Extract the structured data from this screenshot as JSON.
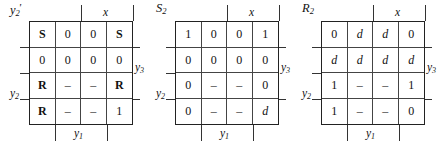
{
  "figure": {
    "type": "karnaugh-maps",
    "map_count": 3
  },
  "maps": [
    {
      "title": "y",
      "title_sub": "2",
      "title_prime": "'",
      "axis": {
        "top": "x",
        "bottom": "y",
        "bottom_sub": "1",
        "right": "y",
        "right_sub": "3",
        "left": "y",
        "left_sub": "2"
      },
      "rows": [
        [
          {
            "text": "S",
            "style": "bold"
          },
          {
            "text": "0",
            "style": "num"
          },
          {
            "text": "0",
            "style": "num"
          },
          {
            "text": "S",
            "style": "bold"
          }
        ],
        [
          {
            "text": "0",
            "style": "num"
          },
          {
            "text": "0",
            "style": "num"
          },
          {
            "text": "0",
            "style": "num"
          },
          {
            "text": "0",
            "style": "num"
          }
        ],
        [
          {
            "text": "R",
            "style": "bold"
          },
          {
            "text": "–",
            "style": "dash"
          },
          {
            "text": "–",
            "style": "dash"
          },
          {
            "text": "R",
            "style": "bold"
          }
        ],
        [
          {
            "text": "R",
            "style": "bold"
          },
          {
            "text": "–",
            "style": "dash"
          },
          {
            "text": "–",
            "style": "dash"
          },
          {
            "text": "1",
            "style": "num"
          }
        ]
      ]
    },
    {
      "title": "S",
      "title_sub": "2",
      "title_prime": "",
      "axis": {
        "top": "x",
        "bottom": "y",
        "bottom_sub": "1",
        "right": "y",
        "right_sub": "3",
        "left": "y",
        "left_sub": "2"
      },
      "rows": [
        [
          {
            "text": "1",
            "style": "num"
          },
          {
            "text": "0",
            "style": "num"
          },
          {
            "text": "0",
            "style": "num"
          },
          {
            "text": "1",
            "style": "num"
          }
        ],
        [
          {
            "text": "0",
            "style": "num"
          },
          {
            "text": "0",
            "style": "num"
          },
          {
            "text": "0",
            "style": "num"
          },
          {
            "text": "0",
            "style": "num"
          }
        ],
        [
          {
            "text": "0",
            "style": "num"
          },
          {
            "text": "–",
            "style": "dash"
          },
          {
            "text": "–",
            "style": "dash"
          },
          {
            "text": "0",
            "style": "num"
          }
        ],
        [
          {
            "text": "0",
            "style": "num"
          },
          {
            "text": "–",
            "style": "dash"
          },
          {
            "text": "–",
            "style": "dash"
          },
          {
            "text": "d",
            "style": "ital"
          }
        ]
      ]
    },
    {
      "title": "R",
      "title_sub": "2",
      "title_prime": "",
      "axis": {
        "top": "x",
        "bottom": "y",
        "bottom_sub": "1",
        "right": "y",
        "right_sub": "3",
        "left": "y",
        "left_sub": "2"
      },
      "rows": [
        [
          {
            "text": "0",
            "style": "num"
          },
          {
            "text": "d",
            "style": "ital"
          },
          {
            "text": "d",
            "style": "ital"
          },
          {
            "text": "0",
            "style": "num"
          }
        ],
        [
          {
            "text": "d",
            "style": "ital"
          },
          {
            "text": "d",
            "style": "ital"
          },
          {
            "text": "d",
            "style": "ital"
          },
          {
            "text": "d",
            "style": "ital"
          }
        ],
        [
          {
            "text": "1",
            "style": "num"
          },
          {
            "text": "–",
            "style": "dash"
          },
          {
            "text": "–",
            "style": "dash"
          },
          {
            "text": "1",
            "style": "num"
          }
        ],
        [
          {
            "text": "1",
            "style": "num"
          },
          {
            "text": "–",
            "style": "dash"
          },
          {
            "text": "–",
            "style": "dash"
          },
          {
            "text": "0",
            "style": "num"
          }
        ]
      ]
    }
  ]
}
